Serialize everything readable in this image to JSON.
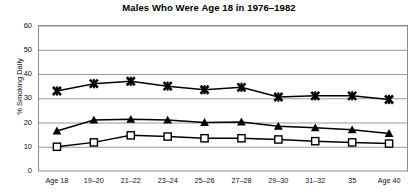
{
  "chart_data": {
    "type": "line",
    "title": "Males Who Were Age 18 in 1976–1982",
    "xlabel": "",
    "ylabel": "% Smoking Daily",
    "categories": [
      "Age 18",
      "19–20",
      "21–22",
      "23–24",
      "25–26",
      "27–28",
      "29–30",
      "31–32",
      "35",
      "Age 40"
    ],
    "ylim": [
      0,
      60
    ],
    "yticks": [
      0,
      10,
      20,
      30,
      40,
      50,
      60
    ],
    "ytick_labels": [
      "0",
      "10",
      "20",
      "30",
      "40",
      "50",
      "60"
    ],
    "grid": true,
    "grid_axis": "y",
    "legend": "none",
    "series": [
      {
        "name": "series-x-marker",
        "marker": "x-star",
        "color": "#000000",
        "values": [
          33.0,
          36.0,
          37.0,
          35.0,
          33.5,
          34.5,
          30.5,
          31.0,
          31.0,
          29.5
        ]
      },
      {
        "name": "series-triangle-marker",
        "marker": "filled-triangle",
        "color": "#000000",
        "values": [
          16.5,
          21.0,
          21.3,
          21.0,
          20.0,
          20.2,
          18.5,
          17.8,
          17.0,
          15.5
        ]
      },
      {
        "name": "series-square-marker",
        "marker": "open-square",
        "color": "#000000",
        "values": [
          10.0,
          11.8,
          14.7,
          14.2,
          13.5,
          13.5,
          13.0,
          12.3,
          11.8,
          11.3
        ]
      }
    ]
  },
  "colors": {
    "line": "#000000",
    "grid": "#9a9a9a",
    "frame": "#8c8c8c",
    "text": "#000000",
    "background": "#ffffff"
  }
}
